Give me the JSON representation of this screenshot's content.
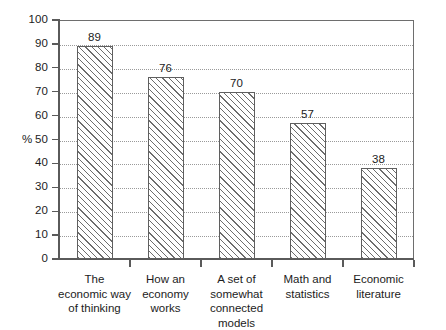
{
  "chart_data": {
    "type": "bar",
    "title": "",
    "xlabel": "",
    "ylabel": "%",
    "ylim": [
      0,
      100
    ],
    "ytick_step": 10,
    "ytick_labels": [
      "0",
      "10",
      "20",
      "30",
      "40",
      "50",
      "60",
      "70",
      "80",
      "90",
      "100"
    ],
    "grid": true,
    "grid_style": "dotted",
    "legend": "none",
    "value_labels_shown": true,
    "categories": [
      "The\neconomic way\nof thinking",
      "How an\neconomy\nworks",
      "A set of\nsomewhat\nconnected models",
      "Math and\nstatistics",
      "Economic\nliterature"
    ],
    "values": [
      89,
      76,
      70,
      57,
      38
    ],
    "value_labels": [
      "89",
      "76",
      "70",
      "57",
      "38"
    ],
    "bar_fill": "diagonal-hatch",
    "colors": {
      "bar_outline": "#5f5f5f",
      "hatch": "#6d6d6d",
      "axis": "#5a5a5a",
      "gridline": "#9a9a9a",
      "text": "#1c1c1c",
      "background": "#ffffff"
    }
  }
}
